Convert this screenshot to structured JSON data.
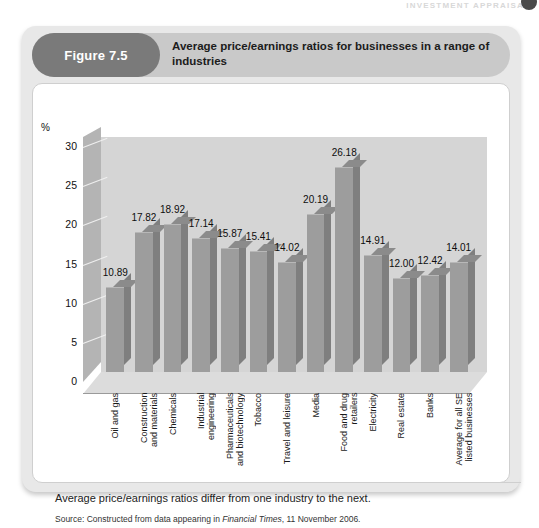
{
  "running_head": "INVESTMENT APPRAISAL",
  "figure": {
    "badge": "Figure 7.5",
    "title": "Average price/earnings ratios for businesses in a range of industries",
    "caption": "Average price/earnings ratios differ from one industry to the next.",
    "source_prefix": "Source: Constructed from data appearing in ",
    "source_italic": "Financial Times",
    "source_suffix": ", 11 November 2006."
  },
  "colors": {
    "badge_bg": "#7a7a7a",
    "header_bg": "#c9c9c9",
    "card_bg": "#e8e8e8",
    "bar_front": "#9d9d9d",
    "bar_side": "#7f7f7f",
    "plot_bg": "#d5d5d5"
  },
  "chart_data": {
    "type": "bar",
    "title": "Average price/earnings ratios for businesses in a range of industries",
    "xlabel": "",
    "ylabel": "%",
    "ylim": [
      0,
      30
    ],
    "yticks": [
      0,
      5,
      10,
      15,
      20,
      25,
      30
    ],
    "grid": true,
    "legend": "none",
    "categories": [
      "Oil and gas",
      "Construction and materials",
      "Chemicals",
      "Industrial engineering",
      "Pharmaceuticals and biotechnology",
      "Tobacco",
      "Travel and leisure",
      "Media",
      "Food and drug retailers",
      "Electricity",
      "Real estate",
      "Banks",
      "Average for all SE listed businesses"
    ],
    "category_lines": [
      [
        "Oil and gas"
      ],
      [
        "Construction",
        "and materials"
      ],
      [
        "Chemicals"
      ],
      [
        "Industrial",
        "engineering"
      ],
      [
        "Pharmaceuticals",
        "and biotechnology"
      ],
      [
        "Tobacco"
      ],
      [
        "Travel and leisure"
      ],
      [
        "Media"
      ],
      [
        "Food and drug",
        "retailers"
      ],
      [
        "Electricity"
      ],
      [
        "Real estate"
      ],
      [
        "Banks"
      ],
      [
        "Average for all SE",
        "listed businesses"
      ]
    ],
    "values": [
      10.89,
      17.82,
      18.92,
      17.14,
      15.87,
      15.41,
      14.02,
      20.19,
      26.18,
      14.91,
      12.0,
      12.42,
      14.01
    ],
    "value_labels": [
      "10.89",
      "17.82",
      "18.92",
      "17.14",
      "15.87",
      "15.41",
      "14.02",
      "20.19",
      "26.18",
      "14.91",
      "12.00",
      "12.42",
      "14.01"
    ]
  }
}
